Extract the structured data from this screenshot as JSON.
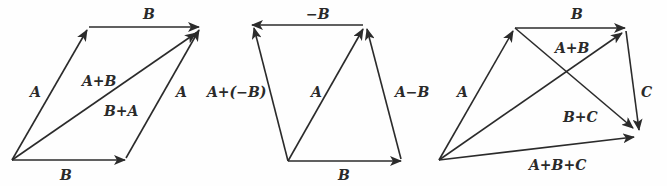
{
  "figure": {
    "panels": [
      {
        "id": "addition-parallelogram",
        "labels": {
          "top_B": "B",
          "left_A": "A",
          "diag_AplusB": "A+B",
          "diag_BplusA": "B+A",
          "right_A": "A",
          "bottom_B": "B"
        }
      },
      {
        "id": "subtraction",
        "labels": {
          "top_negB": "−B",
          "left_AplusNegB": "A+(−B)",
          "middle_A": "A",
          "right_AminusB": "A−B",
          "bottom_B": "B"
        }
      },
      {
        "id": "three-vector-addition",
        "labels": {
          "top_B": "B",
          "left_A": "A",
          "AplusB": "A+B",
          "BplusC": "B+C",
          "right_C": "C",
          "bottom_AplusBplusC": "A+B+C"
        }
      }
    ],
    "stroke_color": "#2b2b2b",
    "background_color": "#fefefe"
  }
}
